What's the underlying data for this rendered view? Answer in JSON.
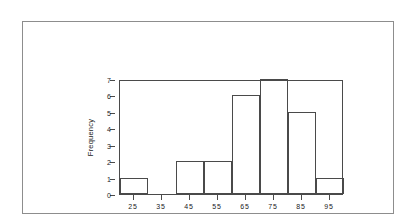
{
  "chart_data": {
    "type": "bar",
    "title": "",
    "subtitle": "",
    "xlabel": "",
    "ylabel": "Frequency",
    "categories": [
      "25",
      "35",
      "45",
      "55",
      "65",
      "75",
      "85",
      "95"
    ],
    "values": [
      1,
      0,
      2,
      2,
      6,
      7,
      5,
      1
    ],
    "bin_edges": [
      20,
      30,
      40,
      50,
      60,
      70,
      80,
      90,
      100
    ],
    "bin_width": 10,
    "xlim": [
      20,
      100
    ],
    "ylim": [
      0,
      7
    ],
    "y_ticks": [
      "0",
      "1",
      "2",
      "3",
      "4",
      "5",
      "6",
      "7"
    ],
    "x_ticks": [
      "25",
      "35",
      "45",
      "55",
      "65",
      "75",
      "85",
      "95"
    ],
    "grid": false,
    "legend": false,
    "legend_position": "none",
    "annotations": [],
    "colors": {
      "bar_fill": "#ffffff",
      "bar_stroke": "#4a4a4a",
      "axis": "#4a4a4a",
      "text": "#1a1a1a",
      "outer_frame": "#8d8d8d",
      "background": "#ffffff"
    }
  }
}
